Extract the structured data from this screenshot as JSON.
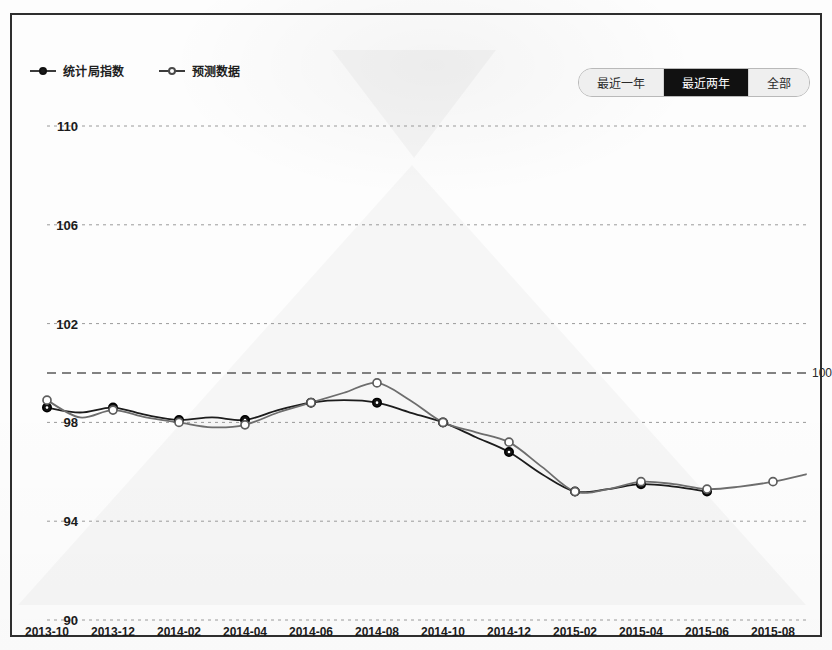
{
  "legend": {
    "items": [
      {
        "label": "统计局指数",
        "marker": "solid-circle"
      },
      {
        "label": "预测数据",
        "marker": "hollow-circle"
      }
    ]
  },
  "range_selector": {
    "options": [
      {
        "label": "最近一年",
        "active": false
      },
      {
        "label": "最近两年",
        "active": true
      },
      {
        "label": "全部",
        "active": false
      }
    ]
  },
  "reference_line": {
    "value": 100,
    "label": "100"
  },
  "chart_data": {
    "type": "line",
    "title": "",
    "xlabel": "",
    "ylabel": "",
    "ylim": [
      90,
      110
    ],
    "yticks": [
      90,
      94,
      98,
      102,
      106,
      110
    ],
    "grid": true,
    "legend_position": "top-left",
    "x": [
      "2013-10",
      "2013-11",
      "2013-12",
      "2014-01",
      "2014-02",
      "2014-03",
      "2014-04",
      "2014-05",
      "2014-06",
      "2014-07",
      "2014-08",
      "2014-09",
      "2014-10",
      "2014-11",
      "2014-12",
      "2015-01",
      "2015-02",
      "2015-03",
      "2015-04",
      "2015-05",
      "2015-06",
      "2015-07",
      "2015-08",
      "2015-09"
    ],
    "xticks": [
      "2013-10",
      "2013-12",
      "2014-02",
      "2014-04",
      "2014-06",
      "2014-08",
      "2014-10",
      "2014-12",
      "2015-02",
      "2015-04",
      "2015-06",
      "2015-08"
    ],
    "series": [
      {
        "name": "统计局指数",
        "marker": "solid-circle",
        "color": "#1c1c1c",
        "values": [
          98.6,
          98.4,
          98.6,
          98.3,
          98.1,
          98.2,
          98.1,
          98.5,
          98.8,
          98.9,
          98.8,
          98.4,
          98.0,
          97.4,
          96.8,
          95.9,
          95.2,
          95.3,
          95.5,
          95.4,
          95.2,
          null,
          null,
          null
        ]
      },
      {
        "name": "预测数据",
        "marker": "hollow-circle",
        "color": "#6d6d6d",
        "values": [
          98.9,
          98.2,
          98.5,
          98.2,
          98.0,
          97.8,
          97.9,
          98.4,
          98.8,
          99.2,
          99.6,
          98.9,
          98.0,
          97.6,
          97.2,
          96.2,
          95.2,
          95.3,
          95.6,
          95.5,
          95.3,
          95.4,
          95.6,
          95.9
        ]
      }
    ]
  }
}
